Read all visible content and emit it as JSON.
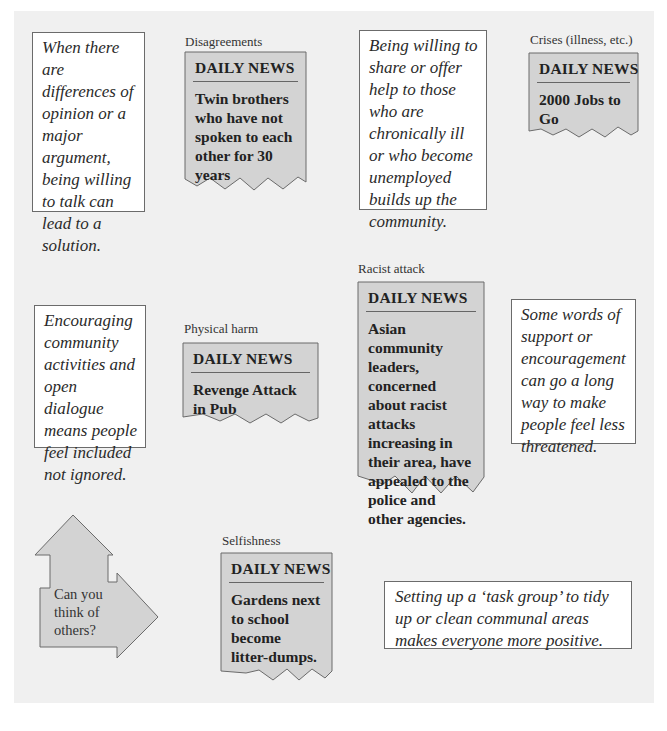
{
  "colors": {
    "panel_bg": "#f0f0f0",
    "news_bg": "#d3d3d3",
    "border": "#6b6b6b"
  },
  "tips": [
    {
      "id": "talk",
      "text": "When there are differences of opinion or a major argument, being willing to talk can lead to a solution."
    },
    {
      "id": "share",
      "text": "Being willing to share or offer help to those who are chronically ill or who become unemployed builds up the community."
    },
    {
      "id": "activities",
      "text": "Encouraging community activities and open dialogue means people feel included not ignored."
    },
    {
      "id": "support",
      "text": "Some words of support or encouragement can go a long way to make people feel less threatened."
    },
    {
      "id": "taskgroup",
      "text": "Setting up a ‘task group’ to tidy up or clean communal areas makes everyone more positive."
    }
  ],
  "news": [
    {
      "id": "disagreements",
      "caption": "Disagreements",
      "masthead": "DAILY NEWS",
      "headline": "Twin brothers who have not spoken to each other for 30 years"
    },
    {
      "id": "crises",
      "caption": "Crises (illness, etc.)",
      "masthead": "DAILY NEWS",
      "headline": "2000 Jobs to Go"
    },
    {
      "id": "physical",
      "caption": "Physical harm",
      "masthead": "DAILY NEWS",
      "headline": "Revenge Attack in Pub"
    },
    {
      "id": "racist",
      "caption": "Racist attack",
      "masthead": "DAILY NEWS",
      "headline": "Asian community leaders, concerned about racist attacks increasing in their area, have appealed to the police and other agencies."
    },
    {
      "id": "selfishness",
      "caption": "Selfishness",
      "masthead": "DAILY NEWS",
      "headline": "Gardens next to school become litter-dumps."
    }
  ],
  "prompt": {
    "lines": [
      "Can you",
      "think of",
      "others?"
    ]
  }
}
